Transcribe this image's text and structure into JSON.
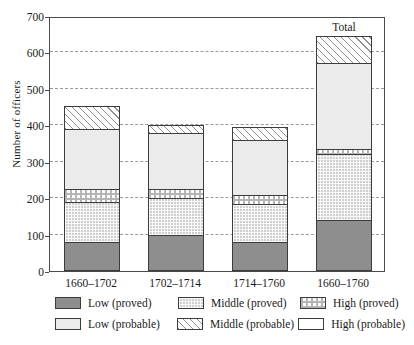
{
  "chart_data": {
    "type": "bar",
    "subtype": "stacked-bar",
    "title": "",
    "xlabel": "",
    "ylabel": "Number of officers",
    "ylim": [
      0,
      700
    ],
    "yticks": [
      0,
      100,
      200,
      300,
      400,
      500,
      600,
      700
    ],
    "grid": true,
    "legend_position": "below-axes",
    "categories": [
      "1660–1702",
      "1702–1714",
      "1714–1760",
      "1660–1760"
    ],
    "annotations": [
      {
        "text": "Total",
        "category": "1660–1760"
      }
    ],
    "series": [
      {
        "name": "Low (proved)",
        "pattern": "solid-dark-gray",
        "color": "#8e8e8e",
        "values": [
          80,
          100,
          80,
          140
        ]
      },
      {
        "name": "Middle (proved)",
        "pattern": "fine-checker",
        "color": "#cfcfcf",
        "values": [
          110,
          100,
          105,
          180
        ]
      },
      {
        "name": "High (proved)",
        "pattern": "coarse-checker",
        "color": "#ffffff",
        "values": [
          35,
          25,
          25,
          15
        ]
      },
      {
        "name": "Low (probable)",
        "pattern": "solid-light-gray",
        "color": "#ebebeb",
        "values": [
          165,
          155,
          150,
          235
        ]
      },
      {
        "name": "Middle (probable)",
        "pattern": "diagonal-hatch",
        "color": "#ffffff",
        "values": [
          63,
          20,
          35,
          75
        ]
      },
      {
        "name": "High (probable)",
        "pattern": "empty-white",
        "color": "#ffffff",
        "values": [
          0,
          0,
          0,
          0
        ]
      }
    ],
    "totals": [
      453,
      400,
      395,
      645
    ]
  },
  "legend": {
    "entries": [
      {
        "label": "Low (proved)"
      },
      {
        "label": "Middle (proved)"
      },
      {
        "label": "High (proved)"
      },
      {
        "label": "Low (probable)"
      },
      {
        "label": "Middle (probable)"
      },
      {
        "label": "High (probable)"
      }
    ]
  }
}
